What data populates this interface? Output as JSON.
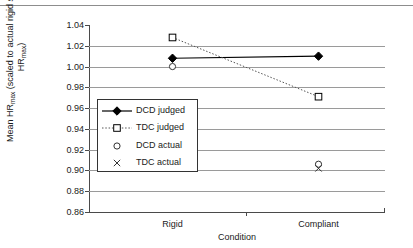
{
  "figure": {
    "y_axis_title_main": "Mean HR",
    "y_axis_title_sub1": "max",
    "y_axis_title_mid": " (scaled to actual rigid surface HR",
    "y_axis_title_sub2": "max",
    "y_axis_title_end": ")",
    "x_axis_title": "Condition"
  },
  "chart_data": {
    "type": "scatter",
    "title": "",
    "xlabel": "Condition",
    "ylabel": "Mean HRmax (scaled to actual rigid surface HRmax)",
    "categories": [
      "Rigid",
      "Compliant"
    ],
    "ylim": [
      0.86,
      1.04
    ],
    "ytick_step": 0.02,
    "yticks": [
      "1.04",
      "1.02",
      "1.00",
      "0.98",
      "0.96",
      "0.94",
      "0.92",
      "0.90",
      "0.88",
      "0.86"
    ],
    "ytick_values": [
      1.04,
      1.02,
      1.0,
      0.98,
      0.96,
      0.94,
      0.92,
      0.9,
      0.88,
      0.86
    ],
    "grid": true,
    "grid_axis": "y",
    "legend_position": "center-left-inside",
    "series": [
      {
        "name": "DCD judged",
        "marker": "filled-diamond",
        "line": "solid",
        "color": "#000000",
        "values": [
          1.008,
          1.01
        ]
      },
      {
        "name": "TDC judged",
        "marker": "open-square",
        "line": "dotted",
        "color": "#000000",
        "values": [
          1.028,
          0.971
        ]
      },
      {
        "name": "DCD actual",
        "marker": "open-circle",
        "line": "none",
        "color": "#000000",
        "values": [
          1.0,
          0.906
        ]
      },
      {
        "name": "TDC actual",
        "marker": "cross",
        "line": "none",
        "color": "#000000",
        "values": [
          null,
          0.902
        ]
      }
    ]
  },
  "legend": {
    "items": [
      {
        "label": "DCD judged",
        "key": "filled-diamond-line-key"
      },
      {
        "label": "TDC judged",
        "key": "open-square-dotted-key"
      },
      {
        "label": "DCD actual",
        "key": "open-circle-key"
      },
      {
        "label": "TDC actual",
        "key": "cross-key"
      }
    ]
  }
}
